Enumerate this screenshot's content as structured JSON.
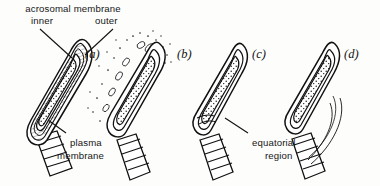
{
  "figure": {
    "background_color": "#fdfdfc",
    "ink_color": "#111111",
    "labels": {
      "acrosomal_membrane": "acrosomal membrane",
      "inner": "inner",
      "outer": "outer",
      "plasma_membrane_line1": "plasma",
      "plasma_membrane_line2": "membrane",
      "equatorial_region_line1": "equatorial",
      "equatorial_region_line2": "region"
    },
    "panels": [
      {
        "letter": "(a)",
        "name": "intact-acrosome",
        "description": "intact sperm head with multilayered acrosomal cap, inner and outer acrosomal membranes and plasma membrane"
      },
      {
        "letter": "(b)",
        "name": "vesiculating-acrosome",
        "description": "acrosome reaction underway, outer acrosomal membrane and plasma membrane fusing into vesicles"
      },
      {
        "letter": "(c)",
        "name": "acrosome-lost",
        "description": "acrosomal cap shed, bare inner acrosomal membrane over the nucleus"
      },
      {
        "letter": "(d)",
        "name": "membrane-trailing",
        "description": "residual membrane trailing behind the sperm head"
      }
    ]
  }
}
